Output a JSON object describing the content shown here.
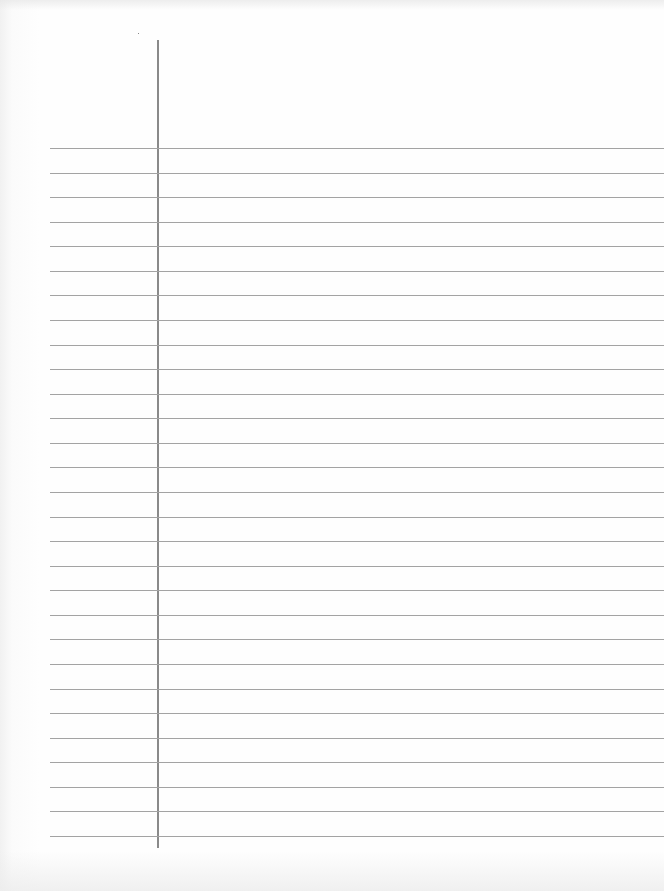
{
  "document": {
    "type": "lined-paper",
    "background_color": "#fefefe",
    "rule_color": "#a3a3a3",
    "margin_line_color": "#8a8a8a",
    "rule_count": 29,
    "first_rule_y": 148,
    "rule_spacing": 24.57,
    "rule_left_x": 50,
    "margin_line": {
      "x": 157,
      "top_y": 40,
      "bottom_y": 848
    }
  }
}
